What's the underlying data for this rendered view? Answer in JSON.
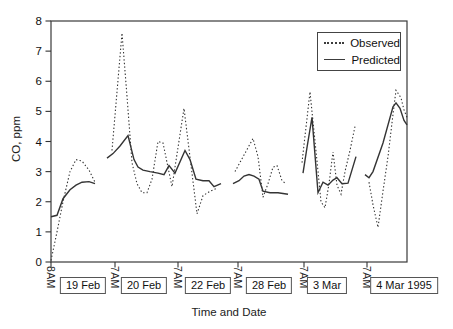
{
  "chart_data": {
    "type": "line",
    "title": "",
    "ylabel": "CO, ppm",
    "xlabel": "Time and Date",
    "ylim": [
      0,
      8
    ],
    "y_ticks": [
      0,
      1,
      2,
      3,
      4,
      5,
      6,
      7,
      8
    ],
    "x_ticks": [
      {
        "label": "8AM",
        "px": 51
      },
      {
        "label": "7AM",
        "px": 115
      },
      {
        "label": "7AM",
        "px": 178
      },
      {
        "label": "7AM",
        "px": 238
      },
      {
        "label": "7AM",
        "px": 304
      },
      {
        "label": "7AM",
        "px": 367
      }
    ],
    "date_labels": [
      {
        "label": "19 Feb",
        "center_px": 83
      },
      {
        "label": "20 Feb",
        "center_px": 144
      },
      {
        "label": "22 Feb",
        "center_px": 208
      },
      {
        "label": "28 Feb",
        "center_px": 269
      },
      {
        "label": "3 Mar",
        "center_px": 327
      },
      {
        "label": "4 Mar 1995",
        "center_px": 404
      }
    ],
    "legend_items": [
      {
        "label": "Observed",
        "style": "dotted"
      },
      {
        "label": "Predicted",
        "style": "solid"
      }
    ],
    "line_color": "#343434",
    "legend_position": "top-right",
    "grid": false,
    "series": [
      {
        "name": "Observed",
        "style": "dotted",
        "segments": [
          [
            [
              51,
              0.05
            ],
            [
              57,
              1.0
            ],
            [
              63,
              2.0
            ],
            [
              70,
              3.0
            ],
            [
              76,
              3.4
            ],
            [
              82,
              3.35
            ],
            [
              89,
              3.05
            ],
            [
              95,
              2.65
            ]
          ],
          [
            [
              112,
              3.7
            ],
            [
              122,
              7.6
            ],
            [
              127,
              5.5
            ],
            [
              132,
              3.3
            ],
            [
              137,
              2.6
            ],
            [
              142,
              2.3
            ],
            [
              147,
              2.3
            ],
            [
              152,
              2.75
            ],
            [
              158,
              4.0
            ],
            [
              163,
              3.95
            ],
            [
              172,
              2.5
            ],
            [
              184,
              5.1
            ],
            [
              197,
              1.6
            ],
            [
              203,
              2.2
            ],
            [
              210,
              2.35
            ],
            [
              217,
              2.45
            ]
          ],
          [
            [
              235,
              3.0
            ],
            [
              253,
              4.1
            ],
            [
              258,
              3.5
            ],
            [
              263,
              2.15
            ],
            [
              268,
              2.6
            ],
            [
              273,
              3.15
            ],
            [
              277,
              3.2
            ],
            [
              282,
              2.7
            ],
            [
              286,
              2.6
            ]
          ],
          [
            [
              302,
              3.3
            ],
            [
              310,
              5.65
            ],
            [
              317,
              3.35
            ],
            [
              321,
              2.0
            ],
            [
              325,
              1.8
            ],
            [
              329,
              2.6
            ],
            [
              333,
              3.65
            ],
            [
              337,
              2.55
            ],
            [
              341,
              2.25
            ],
            [
              345,
              3.0
            ],
            [
              350,
              3.7
            ],
            [
              355,
              4.5
            ]
          ],
          [
            [
              369,
              2.65
            ],
            [
              373,
              1.9
            ],
            [
              378,
              1.15
            ],
            [
              383,
              2.35
            ],
            [
              388,
              3.5
            ],
            [
              393,
              4.9
            ],
            [
              396,
              5.7
            ],
            [
              401,
              5.45
            ],
            [
              404,
              5.05
            ],
            [
              407,
              4.8
            ]
          ]
        ]
      },
      {
        "name": "Predicted",
        "style": "solid",
        "segments": [
          [
            [
              51,
              1.5
            ],
            [
              57,
              1.55
            ],
            [
              63,
              2.1
            ],
            [
              70,
              2.4
            ],
            [
              76,
              2.55
            ],
            [
              82,
              2.65
            ],
            [
              89,
              2.67
            ],
            [
              95,
              2.6
            ]
          ],
          [
            [
              107,
              3.45
            ],
            [
              113,
              3.6
            ],
            [
              120,
              3.85
            ],
            [
              128,
              4.2
            ],
            [
              134,
              3.4
            ],
            [
              138,
              3.15
            ],
            [
              143,
              3.05
            ],
            [
              150,
              3.0
            ],
            [
              158,
              2.95
            ],
            [
              164,
              2.9
            ],
            [
              169,
              3.2
            ],
            [
              175,
              2.95
            ],
            [
              185,
              3.7
            ],
            [
              190,
              3.4
            ],
            [
              196,
              2.75
            ],
            [
              203,
              2.7
            ],
            [
              209,
              2.7
            ],
            [
              214,
              2.5
            ],
            [
              221,
              2.6
            ]
          ],
          [
            [
              233,
              2.6
            ],
            [
              239,
              2.7
            ],
            [
              244,
              2.85
            ],
            [
              249,
              2.9
            ],
            [
              254,
              2.85
            ],
            [
              259,
              2.75
            ],
            [
              263,
              2.35
            ],
            [
              270,
              2.3
            ],
            [
              278,
              2.3
            ],
            [
              288,
              2.25
            ]
          ],
          [
            [
              303,
              2.95
            ],
            [
              307,
              3.8
            ],
            [
              312,
              4.8
            ],
            [
              318,
              2.3
            ],
            [
              323,
              2.65
            ],
            [
              328,
              2.55
            ],
            [
              333,
              2.72
            ],
            [
              337,
              2.8
            ],
            [
              342,
              2.6
            ],
            [
              348,
              2.62
            ],
            [
              356,
              3.5
            ]
          ],
          [
            [
              365,
              2.9
            ],
            [
              369,
              2.8
            ],
            [
              373,
              3.0
            ],
            [
              383,
              3.95
            ],
            [
              393,
              5.15
            ],
            [
              396,
              5.28
            ],
            [
              400,
              5.1
            ],
            [
              404,
              4.7
            ],
            [
              407,
              4.55
            ]
          ]
        ]
      }
    ]
  }
}
